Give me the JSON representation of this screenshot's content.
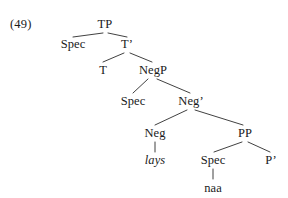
{
  "figure": {
    "example_number": "(49)",
    "type": "syntax-tree",
    "background_color": "#ffffff",
    "text_color": "#1a1a1a",
    "line_color": "#2b2b2b"
  },
  "tree": {
    "nodes": [
      {
        "id": "tp",
        "label": "TP",
        "x": 105,
        "y": 18,
        "style": "plain"
      },
      {
        "id": "spec1",
        "label": "Spec",
        "x": 73,
        "y": 38,
        "style": "plain"
      },
      {
        "id": "tbar",
        "label": "T’",
        "x": 127,
        "y": 38,
        "style": "plain"
      },
      {
        "id": "t",
        "label": "T",
        "x": 103,
        "y": 64,
        "style": "plain"
      },
      {
        "id": "negp",
        "label": "NegP",
        "x": 153,
        "y": 64,
        "style": "plain"
      },
      {
        "id": "spec2",
        "label": "Spec",
        "x": 133,
        "y": 95,
        "style": "plain"
      },
      {
        "id": "negbar",
        "label": "Neg’",
        "x": 191,
        "y": 95,
        "style": "plain"
      },
      {
        "id": "neg",
        "label": "Neg",
        "x": 155,
        "y": 127,
        "style": "plain"
      },
      {
        "id": "pp",
        "label": "PP",
        "x": 245,
        "y": 127,
        "style": "plain"
      },
      {
        "id": "lays",
        "label": "lays",
        "x": 155,
        "y": 154,
        "style": "italic"
      },
      {
        "id": "spec3",
        "label": "Spec",
        "x": 213,
        "y": 154,
        "style": "plain"
      },
      {
        "id": "pbar",
        "label": "P’",
        "x": 271,
        "y": 154,
        "style": "plain"
      },
      {
        "id": "naa",
        "label": "naa",
        "x": 213,
        "y": 182,
        "style": "plain"
      }
    ],
    "edges": [
      {
        "from": "tp",
        "to": "spec1",
        "x1": 103,
        "y1": 33,
        "x2": 73,
        "y2": 37
      },
      {
        "from": "tp",
        "to": "tbar",
        "x1": 108,
        "y1": 33,
        "x2": 127,
        "y2": 37
      },
      {
        "from": "tbar",
        "to": "t",
        "x1": 124,
        "y1": 53,
        "x2": 103,
        "y2": 62
      },
      {
        "from": "tbar",
        "to": "negp",
        "x1": 130,
        "y1": 53,
        "x2": 152,
        "y2": 62
      },
      {
        "from": "negp",
        "to": "spec2",
        "x1": 148,
        "y1": 79,
        "x2": 133,
        "y2": 93
      },
      {
        "from": "negp",
        "to": "negbar",
        "x1": 157,
        "y1": 79,
        "x2": 190,
        "y2": 93
      },
      {
        "from": "negbar",
        "to": "neg",
        "x1": 187,
        "y1": 110,
        "x2": 155,
        "y2": 125
      },
      {
        "from": "negbar",
        "to": "pp",
        "x1": 195,
        "y1": 110,
        "x2": 243,
        "y2": 125
      },
      {
        "from": "neg",
        "to": "lays",
        "x1": 155,
        "y1": 142,
        "x2": 155,
        "y2": 152
      },
      {
        "from": "pp",
        "to": "spec3",
        "x1": 242,
        "y1": 142,
        "x2": 214,
        "y2": 152
      },
      {
        "from": "pp",
        "to": "pbar",
        "x1": 248,
        "y1": 142,
        "x2": 270,
        "y2": 152
      },
      {
        "from": "spec3",
        "to": "naa",
        "x1": 213,
        "y1": 169,
        "x2": 213,
        "y2": 179
      }
    ]
  }
}
